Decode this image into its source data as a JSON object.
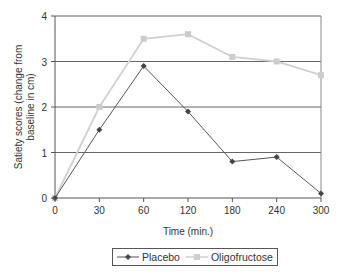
{
  "chart_data": {
    "type": "line",
    "title": "",
    "xlabel": "Time (min.)",
    "ylabel": "Satiety scores (change from baseline in cm)",
    "x": [
      "0",
      "30",
      "60",
      "120",
      "180",
      "240",
      "300"
    ],
    "ylim": [
      0,
      4
    ],
    "yticks": [
      "0",
      "1",
      "2",
      "3",
      "4"
    ],
    "grid": "horizontal",
    "legend_position": "bottom",
    "series": [
      {
        "name": "Placebo",
        "color": "#555555",
        "marker": "diamond",
        "values": [
          0,
          1.5,
          2.9,
          1.9,
          0.8,
          0.9,
          0.1
        ]
      },
      {
        "name": "Oligofructose",
        "color": "#d0d0d0",
        "marker": "square",
        "values": [
          0,
          2.0,
          3.5,
          3.6,
          3.1,
          3.0,
          2.7
        ]
      }
    ]
  },
  "legend": {
    "items": [
      {
        "label": "Placebo"
      },
      {
        "label": "Oligofructose"
      }
    ]
  }
}
